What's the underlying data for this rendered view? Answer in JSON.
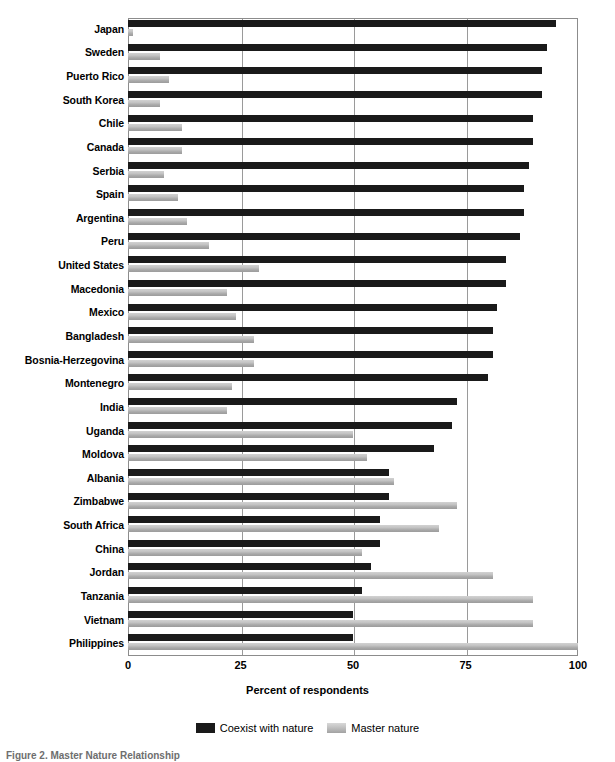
{
  "chart_data": {
    "type": "bar",
    "orientation": "horizontal",
    "title": "",
    "xlabel": "Percent of respondents",
    "ylabel": "",
    "xlim": [
      0,
      100
    ],
    "xticks": [
      0,
      25,
      50,
      75,
      100
    ],
    "grid": true,
    "legend_position": "bottom",
    "legend": [
      "Coexist with nature",
      "Master nature"
    ],
    "categories": [
      "Japan",
      "Sweden",
      "Puerto Rico",
      "South Korea",
      "Chile",
      "Canada",
      "Serbia",
      "Spain",
      "Argentina",
      "Peru",
      "United States",
      "Macedonia",
      "Mexico",
      "Bangladesh",
      "Bosnia-Herzegovina",
      "Montenegro",
      "India",
      "Uganda",
      "Moldova",
      "Albania",
      "Zimbabwe",
      "South Africa",
      "China",
      "Jordan",
      "Tanzania",
      "Vietnam",
      "Philippines"
    ],
    "series": [
      {
        "name": "Coexist with nature",
        "color": "#1a1a1a",
        "values": [
          95,
          93,
          92,
          92,
          90,
          90,
          89,
          88,
          88,
          87,
          84,
          84,
          82,
          81,
          81,
          80,
          73,
          72,
          68,
          58,
          58,
          56,
          56,
          54,
          52,
          50,
          50
        ]
      },
      {
        "name": "Master nature",
        "color": "#b9b9b9",
        "values": [
          1,
          7,
          9,
          7,
          12,
          12,
          8,
          11,
          13,
          18,
          29,
          22,
          24,
          28,
          28,
          23,
          22,
          50,
          53,
          59,
          73,
          69,
          52,
          81,
          90,
          90,
          100
        ]
      }
    ]
  },
  "axis": {
    "tick_labels": [
      "0",
      "25",
      "50",
      "75",
      "100"
    ],
    "x_title": "Percent of respondents"
  },
  "legend": {
    "items": [
      {
        "label": "Coexist with nature",
        "swatch": "dark-swatch"
      },
      {
        "label": "Master nature",
        "swatch": "light-swatch"
      }
    ]
  },
  "caption": {
    "text": "Figure 2.  Master Nature Relationship"
  }
}
